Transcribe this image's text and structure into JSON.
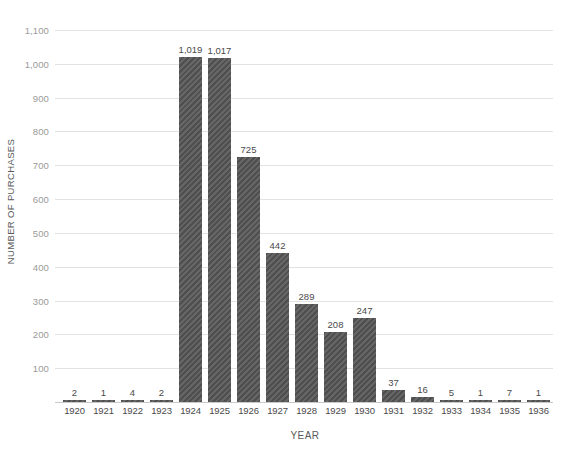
{
  "chart_data": {
    "type": "bar",
    "title": "",
    "xlabel": "YEAR",
    "ylabel": "NUMBER OF PURCHASES",
    "categories": [
      "1920",
      "1921",
      "1922",
      "1923",
      "1924",
      "1925",
      "1926",
      "1927",
      "1928",
      "1929",
      "1930",
      "1931",
      "1932",
      "1933",
      "1934",
      "1935",
      "1936"
    ],
    "values": [
      2,
      1,
      4,
      2,
      1019,
      1017,
      725,
      442,
      289,
      208,
      247,
      37,
      16,
      5,
      1,
      7,
      1
    ],
    "value_labels": [
      "2",
      "1",
      "4",
      "2",
      "1,019",
      "1,017",
      "725",
      "442",
      "289",
      "208",
      "247",
      "37",
      "16",
      "5",
      "1",
      "7",
      "1"
    ],
    "ylim": [
      0,
      1100
    ],
    "ytick_values": [
      1100,
      1000,
      900,
      800,
      700,
      600,
      500,
      400,
      300,
      200,
      100
    ],
    "ytick_labels": [
      "1,100",
      "1,000",
      "900",
      "800",
      "700",
      "600",
      "500",
      "400",
      "300",
      "200",
      "100"
    ],
    "grid": true,
    "legend": false,
    "bar_color": "#4f4f4f",
    "gridline_color": "#e2e2e2",
    "baseline_color": "#c9c9c9",
    "text_color": "#4a4a4a",
    "tick_color": "#9a9a9a",
    "background": "#ffffff"
  },
  "title_sliver": {
    "text": ""
  }
}
